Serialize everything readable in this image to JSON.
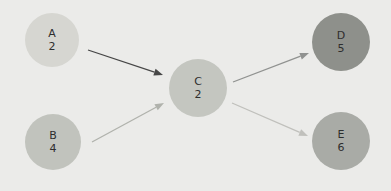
{
  "diagram": {
    "type": "directed-graph",
    "background": "#ebebe9",
    "text_color": "#2e2e2e"
  },
  "nodes": [
    {
      "id": "A",
      "value": "2",
      "x": 52,
      "y": 40,
      "r": 27,
      "color": "#d6d6d1"
    },
    {
      "id": "B",
      "value": "4",
      "x": 53,
      "y": 142,
      "r": 28,
      "color": "#c1c3bd"
    },
    {
      "id": "C",
      "value": "2",
      "x": 198,
      "y": 88,
      "r": 29,
      "color": "#c4c6c0"
    },
    {
      "id": "D",
      "value": "5",
      "x": 341,
      "y": 42,
      "r": 29,
      "color": "#8e908b"
    },
    {
      "id": "E",
      "value": "6",
      "x": 341,
      "y": 141,
      "r": 29,
      "color": "#a9aba6"
    }
  ],
  "edges": [
    {
      "from": "A",
      "to": "C",
      "color": "#474747",
      "x1": 88,
      "y1": 50,
      "x2": 163,
      "y2": 75
    },
    {
      "from": "B",
      "to": "C",
      "color": "#b0b2ac",
      "x1": 92,
      "y1": 142,
      "x2": 164,
      "y2": 103
    },
    {
      "from": "C",
      "to": "D",
      "color": "#909290",
      "x1": 233,
      "y1": 82,
      "x2": 309,
      "y2": 53
    },
    {
      "from": "C",
      "to": "E",
      "color": "#c0c0bc",
      "x1": 232,
      "y1": 103,
      "x2": 308,
      "y2": 136
    }
  ]
}
